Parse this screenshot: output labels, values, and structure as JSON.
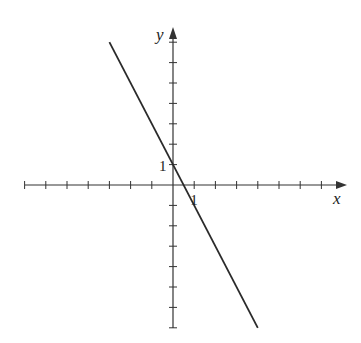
{
  "chart_data": {
    "type": "line",
    "title": "",
    "xlabel": "x",
    "ylabel": "y",
    "xlim": [
      -7,
      8
    ],
    "ylim": [
      -7,
      7
    ],
    "grid": false,
    "x_ticks": [
      -7,
      -6,
      -5,
      -4,
      -3,
      -2,
      -1,
      1,
      2,
      3,
      4,
      5,
      6,
      7
    ],
    "y_ticks": [
      -7,
      -6,
      -5,
      -4,
      -3,
      -2,
      -1,
      1,
      2,
      3,
      4,
      5,
      6,
      7
    ],
    "tick_labels": {
      "x_one": "1",
      "y_one": "1"
    },
    "series": [
      {
        "name": "line",
        "equation": "y = -2x + 1",
        "slope": -2,
        "intercept": 1,
        "x_range": [
          -3,
          4
        ]
      }
    ],
    "colors": {
      "axis": "#333333",
      "line": "#2a2a2a"
    }
  }
}
